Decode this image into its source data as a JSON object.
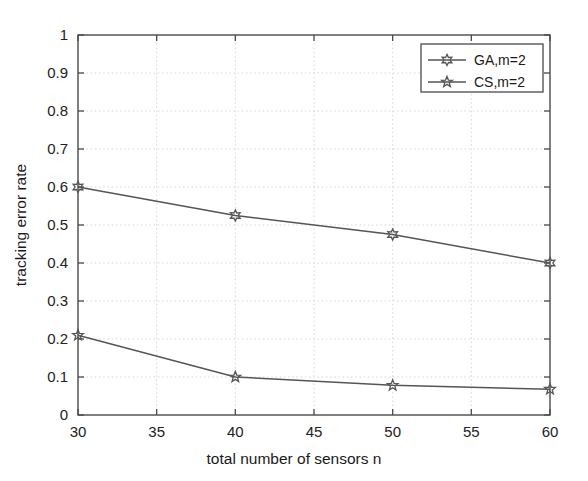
{
  "chart_data": {
    "type": "line",
    "title": "",
    "xlabel": "total number of sensors n",
    "ylabel": "tracking error rate",
    "x": [
      30,
      40,
      50,
      60
    ],
    "xlim": [
      30,
      60
    ],
    "ylim": [
      0,
      1
    ],
    "xticks": [
      30,
      35,
      40,
      45,
      50,
      55,
      60
    ],
    "xtick_labels": [
      "30",
      "35",
      "40",
      "45",
      "50",
      "55",
      "60"
    ],
    "yticks": [
      0,
      0.1,
      0.2,
      0.3,
      0.4,
      0.5,
      0.6,
      0.7,
      0.8,
      0.9,
      1
    ],
    "ytick_labels": [
      "0",
      "0.1",
      "0.2",
      "0.3",
      "0.4",
      "0.5",
      "0.6",
      "0.7",
      "0.8",
      "0.9",
      "1"
    ],
    "grid": true,
    "legend_position": "upper right",
    "series": [
      {
        "name": "GA,m=2",
        "marker": "hexagram",
        "color": "#555555",
        "values": [
          0.6,
          0.525,
          0.475,
          0.4
        ]
      },
      {
        "name": "CS,m=2",
        "marker": "pentagram",
        "color": "#555555",
        "values": [
          0.21,
          0.1,
          0.078,
          0.068
        ]
      }
    ]
  },
  "legend": {
    "entries": [
      {
        "label": "GA,m=2"
      },
      {
        "label": "CS,m=2"
      }
    ]
  },
  "axes": {
    "x_title": "total number of sensors n",
    "y_title": "tracking error rate"
  }
}
